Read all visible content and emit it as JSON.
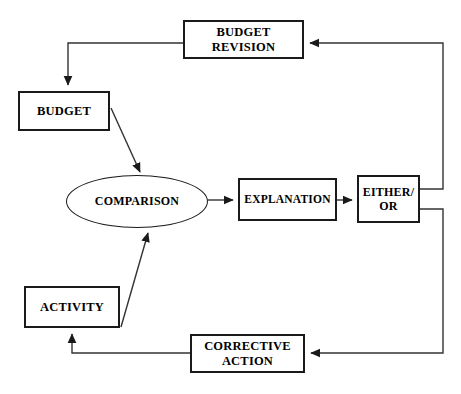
{
  "diagram": {
    "type": "flowchart",
    "canvas": {
      "width": 461,
      "height": 394,
      "background": "#ffffff"
    },
    "style": {
      "node_border_color": "#1a1a1a",
      "node_fill_color": "#ffffff",
      "connector_color": "#333333",
      "text_color": "#000000"
    },
    "nodes": [
      {
        "id": "budget-revision",
        "label": "BUDGET\nREVISION",
        "shape": "rectangle"
      },
      {
        "id": "budget",
        "label": "BUDGET",
        "shape": "rectangle"
      },
      {
        "id": "comparison",
        "label": "COMPARISON",
        "shape": "ellipse"
      },
      {
        "id": "explanation",
        "label": "EXPLANATION",
        "shape": "rectangle"
      },
      {
        "id": "either-or",
        "label": "EITHER/\nOR",
        "shape": "rectangle"
      },
      {
        "id": "activity",
        "label": "ACTIVITY",
        "shape": "rectangle"
      },
      {
        "id": "corrective-action",
        "label": "CORRECTIVE\nACTION",
        "shape": "rectangle"
      }
    ],
    "connectors": [
      {
        "id": "budget-revision-to-budget",
        "from": "budget-revision",
        "to": "budget",
        "routing": "orthogonal",
        "arrow": "down"
      },
      {
        "id": "budget-to-comparison",
        "from": "budget",
        "to": "comparison",
        "routing": "diagonal",
        "arrow": "down-right"
      },
      {
        "id": "comparison-to-explanation",
        "from": "comparison",
        "to": "explanation",
        "routing": "straight",
        "arrow": "right"
      },
      {
        "id": "explanation-to-either-or",
        "from": "explanation",
        "to": "either-or",
        "routing": "straight",
        "arrow": "right"
      },
      {
        "id": "either-or-to-budget-revision",
        "from": "either-or",
        "to": "budget-revision",
        "routing": "orthogonal",
        "arrow": "left"
      },
      {
        "id": "either-or-to-corrective-action",
        "from": "either-or",
        "to": "corrective-action",
        "routing": "orthogonal",
        "arrow": "left"
      },
      {
        "id": "corrective-action-to-activity",
        "from": "corrective-action",
        "to": "activity",
        "routing": "orthogonal",
        "arrow": "up"
      },
      {
        "id": "activity-to-comparison",
        "from": "activity",
        "to": "comparison",
        "routing": "diagonal",
        "arrow": "up-right"
      }
    ]
  }
}
